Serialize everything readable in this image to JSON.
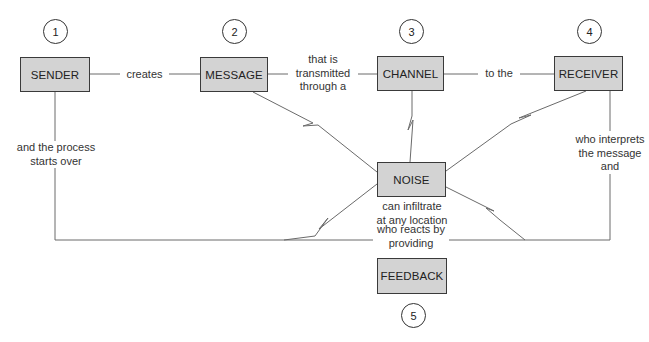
{
  "diagram": {
    "nodes": [
      {
        "id": "sender",
        "label": "SENDER",
        "step": "1"
      },
      {
        "id": "message",
        "label": "MESSAGE",
        "step": "2"
      },
      {
        "id": "channel",
        "label": "CHANNEL",
        "step": "3"
      },
      {
        "id": "receiver",
        "label": "RECEIVER",
        "step": "4"
      },
      {
        "id": "noise",
        "label": "NOISE"
      },
      {
        "id": "feedback",
        "label": "FEEDBACK",
        "step": "5"
      }
    ],
    "edges": [
      {
        "from": "sender",
        "to": "message",
        "label": "creates"
      },
      {
        "from": "message",
        "to": "channel",
        "label_lines": [
          "that is",
          "transmitted",
          "through a"
        ]
      },
      {
        "from": "channel",
        "to": "receiver",
        "label": "to the"
      },
      {
        "from": "receiver",
        "to": "feedback",
        "label_lines": [
          "who interprets",
          "the message",
          "and"
        ]
      },
      {
        "from": "feedback",
        "to": "sender",
        "label_lines": [
          "who reacts by",
          "providing"
        ]
      },
      {
        "from": "sender",
        "to": "sender-return",
        "label_lines": [
          "and the process",
          "starts over"
        ]
      }
    ],
    "noise_note_lines": [
      "can infiltrate",
      "at any location"
    ],
    "colors": {
      "box_fill": "#d3d3d3",
      "line": "#555555",
      "border": "#3a3a3a"
    }
  }
}
